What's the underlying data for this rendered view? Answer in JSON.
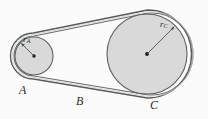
{
  "figure": {
    "kind": "belt-and-pulley-diagram",
    "background_color": "#fbfbfb",
    "ink_color": "#4a4a4a",
    "pulley_fill_color": "#d9d9d9",
    "pulley_stroke_color": "#555555",
    "belt_color": "#555555",
    "label_color": "#2b2b2b"
  },
  "labels": {
    "pulley_a": "A",
    "belt_b": "B",
    "pulley_c": "C",
    "radius_a": "r",
    "radius_a_sub": "A",
    "radius_c": "r",
    "radius_c_sub": "C"
  },
  "geometry": {
    "pulley_a": {
      "cx": 34,
      "cy": 56,
      "r": 19,
      "belt_r": 21.5
    },
    "pulley_c": {
      "cx": 147,
      "cy": 54,
      "r": 40,
      "belt_r": 42.5
    },
    "radius_arrow_a": {
      "x1": 34,
      "y1": 56,
      "x2": 20.5,
      "y2": 42.5
    },
    "radius_arrow_c": {
      "x1": 147,
      "y1": 54,
      "x2": 175.5,
      "y2": 25.5
    },
    "belt_upper_tangent": {
      "x1": 34,
      "y1": 34.5,
      "x2": 147,
      "y2": 11.5
    },
    "belt_lower_tangent": {
      "x1": 34,
      "y1": 77.5,
      "x2": 147,
      "y2": 96.5
    }
  }
}
